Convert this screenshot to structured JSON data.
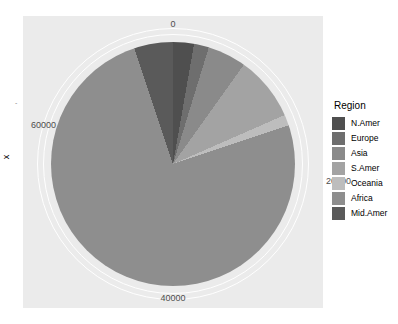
{
  "chart_data": {
    "type": "pie",
    "title": "",
    "xlabel": "",
    "ylabel": "x",
    "categories": [
      "N.Amer",
      "Europe",
      "Asia",
      "S.Amer",
      "Oceania",
      "Africa",
      "Mid.Amer"
    ],
    "values": [
      2100,
      1500,
      3900,
      6500,
      1100,
      57000,
      3900
    ],
    "colors": [
      "#4f4f4f",
      "#6e6e6e",
      "#8a8a8a",
      "#a3a3a3",
      "#bdbdbd",
      "#8e8e8e",
      "#5a5a5a"
    ],
    "axis_ticks": [
      "0",
      "20000",
      "40000",
      "60000"
    ],
    "axis_tick_values": [
      0,
      20000,
      40000,
      60000
    ],
    "axis_max": 76000,
    "grid": true,
    "legend_position": "right",
    "panel_background": "#ebebeb",
    "grid_color": "#ffffff"
  },
  "axes": {
    "y_title": "x",
    "x_title": "",
    "tick_top": "0",
    "tick_right": "20000",
    "tick_bottom": "40000",
    "tick_left": "60000",
    "minor_mark": "-"
  },
  "legend": {
    "title": "Region",
    "items": [
      {
        "label": "N.Amer",
        "color": "#4f4f4f"
      },
      {
        "label": "Europe",
        "color": "#6e6e6e"
      },
      {
        "label": "Asia",
        "color": "#8a8a8a"
      },
      {
        "label": "S.Amer",
        "color": "#a3a3a3"
      },
      {
        "label": "Oceania",
        "color": "#bdbdbd"
      },
      {
        "label": "Africa",
        "color": "#8e8e8e"
      },
      {
        "label": "Mid.Amer",
        "color": "#5a5a5a"
      }
    ]
  }
}
